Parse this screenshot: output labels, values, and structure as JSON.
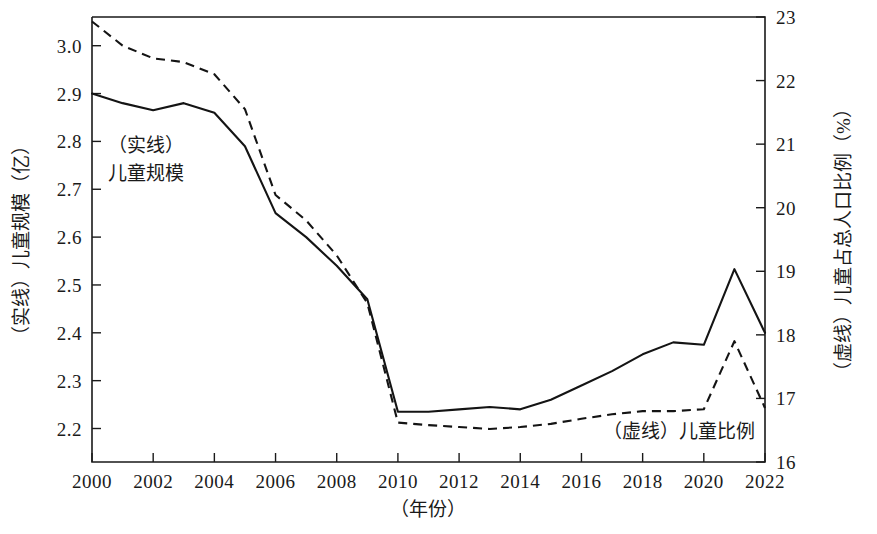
{
  "chart_data": {
    "type": "line",
    "title": "",
    "xlabel": "（年份）",
    "ylabel": "（实线）儿童规模（亿）",
    "y2label": "（虚线）儿童占总人口比例（%）",
    "grid": false,
    "legend_position": "inline-annotation",
    "x": [
      2000,
      2001,
      2002,
      2003,
      2004,
      2005,
      2006,
      2007,
      2008,
      2009,
      2010,
      2011,
      2012,
      2013,
      2014,
      2015,
      2016,
      2017,
      2018,
      2019,
      2020,
      2021,
      2022
    ],
    "xlim": [
      2000,
      2022
    ],
    "xticks": [
      "2000",
      "2002",
      "2004",
      "2006",
      "2008",
      "2010",
      "2012",
      "2014",
      "2016",
      "2018",
      "2020",
      "2022"
    ],
    "ylim": [
      2.13,
      3.06
    ],
    "yticks": [
      "2.2",
      "2.3",
      "2.4",
      "2.5",
      "2.6",
      "2.7",
      "2.8",
      "2.9",
      "3.0"
    ],
    "y2lim": [
      16,
      23
    ],
    "y2ticks": [
      "16",
      "17",
      "18",
      "19",
      "20",
      "21",
      "22",
      "23"
    ],
    "series": [
      {
        "name": "（实线）儿童规模",
        "axis": "left",
        "style": "solid",
        "unit": "亿",
        "values": [
          2.9,
          2.88,
          2.865,
          2.88,
          2.86,
          2.79,
          2.65,
          2.6,
          2.54,
          2.47,
          2.235,
          2.235,
          2.24,
          2.245,
          2.24,
          2.26,
          2.29,
          2.32,
          2.355,
          2.38,
          2.375,
          2.533,
          2.4
        ]
      },
      {
        "name": "（虚线）儿童比例",
        "axis": "right",
        "style": "dashed",
        "unit": "%",
        "values": [
          22.93,
          22.55,
          22.35,
          22.29,
          22.1,
          21.55,
          20.2,
          19.8,
          19.25,
          18.5,
          16.62,
          16.58,
          16.55,
          16.52,
          16.55,
          16.6,
          16.68,
          16.75,
          16.8,
          16.8,
          16.83,
          17.9,
          16.85
        ]
      }
    ],
    "annotations": [
      {
        "id": "solid-note",
        "text_lines": [
          "（实线）",
          "儿童规模"
        ]
      },
      {
        "id": "dashed-note",
        "text_lines": [
          "（虚线）儿童比例"
        ]
      }
    ]
  },
  "figure": {
    "background": "#ffffff",
    "line_color": "#141414",
    "axis_color": "#1a1a1a"
  }
}
